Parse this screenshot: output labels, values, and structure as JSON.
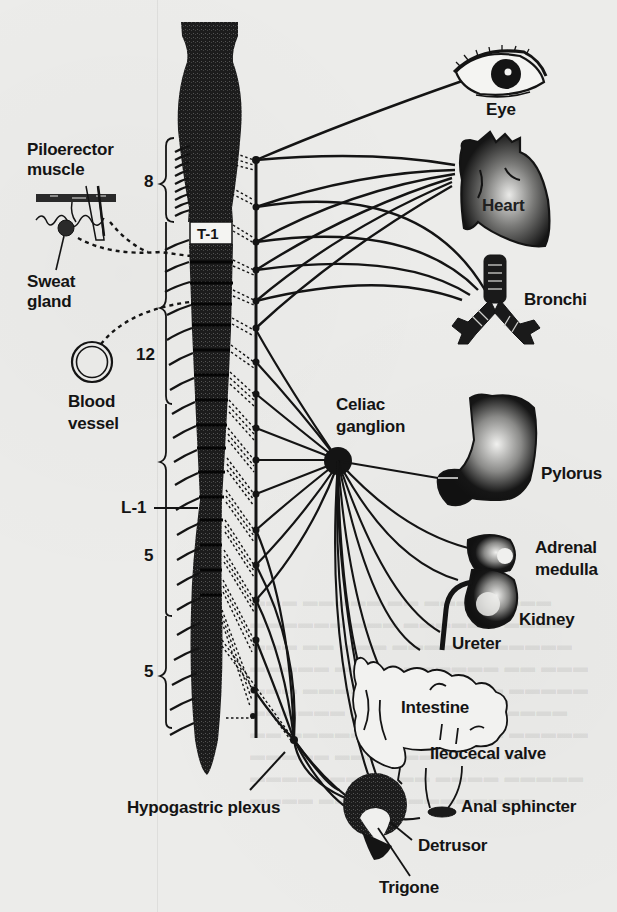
{
  "diagram": {
    "spinal_cord": {
      "segment_label": "T-1",
      "level_labels": [
        {
          "id": "thoracic-8",
          "text": "8"
        },
        {
          "id": "thoracic-12",
          "text": "12"
        },
        {
          "id": "lumbar-1",
          "text": "L-1"
        },
        {
          "id": "lumbar-5",
          "text": "5"
        },
        {
          "id": "sacral-5",
          "text": "5"
        }
      ]
    },
    "left_targets": {
      "piloerector": "Piloerector muscle",
      "piloerector_line1": "Piloerector",
      "piloerector_line2": "muscle",
      "sweat_line1": "Sweat",
      "sweat_line2": "gland",
      "blood_line1": "Blood",
      "blood_line2": "vessel"
    },
    "ganglia": {
      "celiac_line1": "Celiac",
      "celiac_line2": "ganglion",
      "hypogastric": "Hypogastric plexus"
    },
    "organs": {
      "eye": "Eye",
      "heart": "Heart",
      "bronchi": "Bronchi",
      "pylorus": "Pylorus",
      "adrenal_line1": "Adrenal",
      "adrenal_line2": "medulla",
      "kidney": "Kidney",
      "ureter": "Ureter",
      "intestine": "Intestine",
      "ileocecal": "Ileocecal valve",
      "anal": "Anal sphincter",
      "detrusor": "Detrusor",
      "trigone": "Trigone"
    },
    "colors": {
      "ink": "#141414",
      "paper": "#ececea",
      "cord_fill": "#1f1f1f"
    }
  }
}
